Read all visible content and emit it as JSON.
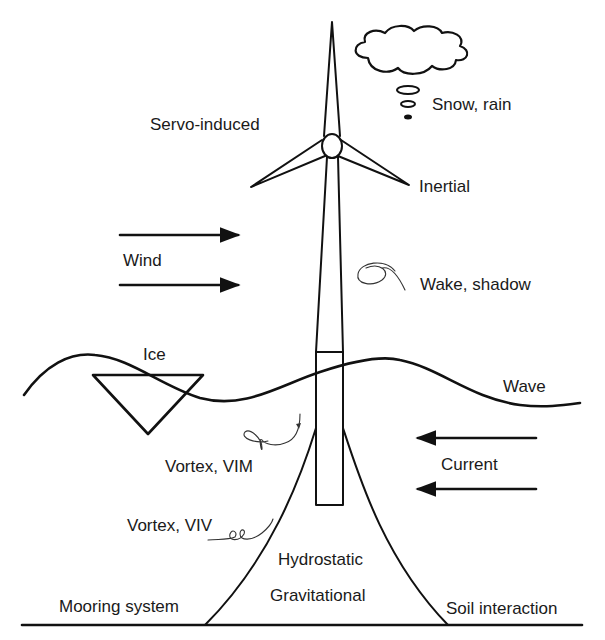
{
  "diagram": {
    "labels": {
      "servo": "Servo-induced",
      "snow_rain": "Snow, rain",
      "inertial": "Inertial",
      "wind": "Wind",
      "wake": "Wake, shadow",
      "ice": "Ice",
      "wave": "Wave",
      "vortex_vim": "Vortex, VIM",
      "current": "Current",
      "vortex_viv": "Vortex, VIV",
      "hydrostatic": "Hydrostatic",
      "gravitational": "Gravitational",
      "mooring": "Mooring system",
      "soil": "Soil interaction"
    },
    "elements": {
      "turbine": "wind-turbine-icon",
      "cloud": "cloud-icon",
      "ice": "ice-triangle-icon",
      "wind_arrows": "arrow-right-icon",
      "current_arrows": "arrow-left-icon",
      "vortex": "vortex-swirl-icon"
    },
    "colors": {
      "line": "#111111",
      "text": "#1a1a1a",
      "background": "#ffffff"
    }
  }
}
